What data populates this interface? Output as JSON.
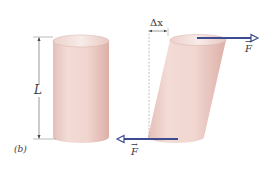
{
  "figure": {
    "panel_label": "(b)",
    "length_label": "L",
    "displacement_label": "Δx",
    "force_label_top": "F",
    "force_label_bottom": "F",
    "colors": {
      "cylinder_fill": "#f1d6d0",
      "cylinder_shade": "#e2bab2",
      "cylinder_top": "#f6e6e2",
      "arrow": "#3d4b8f",
      "dim_line": "#555555"
    }
  }
}
